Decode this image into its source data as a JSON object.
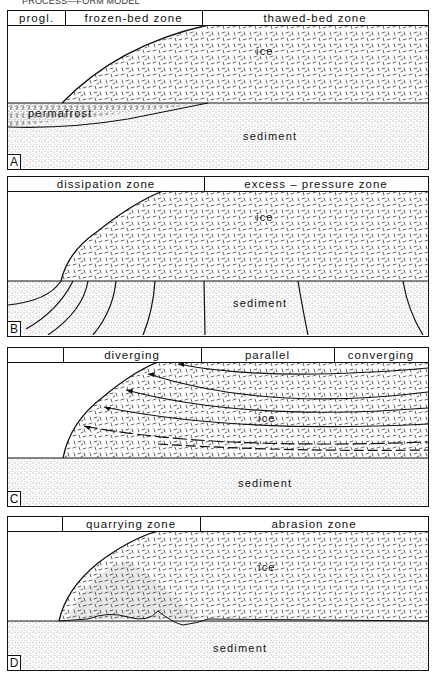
{
  "title": "PROCESS—FORM MODEL",
  "panels": [
    {
      "id": "A",
      "header": [
        "progl.",
        "frozen-bed   zone",
        "thawed-bed   zone"
      ],
      "labels": {
        "ice": "ice",
        "sediment": "sediment",
        "permafrost": "permafrost"
      }
    },
    {
      "id": "B",
      "header": [
        "dissipation   zone",
        "excess – pressure   zone"
      ],
      "labels": {
        "ice": "ice",
        "sediment": "sediment"
      }
    },
    {
      "id": "C",
      "header": [
        "",
        "diverging",
        "parallel",
        "converging"
      ],
      "labels": {
        "ice": "ice",
        "sediment": "sediment"
      }
    },
    {
      "id": "D",
      "header": [
        "",
        "quarrying zone",
        "abrasion  zone"
      ],
      "labels": {
        "ice": "ice",
        "sediment": "sediment"
      }
    }
  ],
  "colors": {
    "line": "#111111",
    "ice_dash": "#3a3a3a",
    "sediment_dot": "#6a6a6a",
    "background": "#ffffff"
  }
}
